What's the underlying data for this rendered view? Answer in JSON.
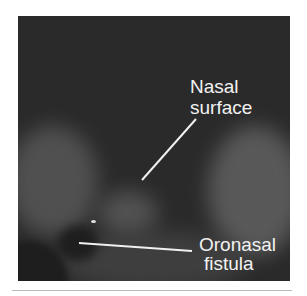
{
  "figure": {
    "type": "endoscopic-photograph",
    "background_color": "#2a2a2a",
    "annotations": [
      {
        "id": "nasal-surface",
        "lines": [
          "Nasal",
          "surface"
        ],
        "pointer": {
          "x1": 196,
          "y1": 119,
          "x2": 142,
          "y2": 180
        }
      },
      {
        "id": "oronasal-fistula",
        "lines": [
          "Oronasal",
          "fistula"
        ],
        "pointer": {
          "x1": 79,
          "y1": 243,
          "x2": 192,
          "y2": 251
        }
      }
    ]
  }
}
